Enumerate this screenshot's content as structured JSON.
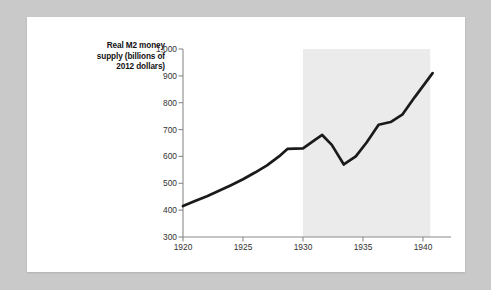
{
  "figure": {
    "background_color": "#c9c9c9",
    "card_color": "#ffffff"
  },
  "chart_data": {
    "type": "line",
    "title": "",
    "xlabel": "",
    "ylabel": "Real M2 money supply (billions of 2012 dollars)",
    "ylabel_lines": [
      "Real M2 money",
      "supply (billions of",
      "2012 dollars)"
    ],
    "xlim": [
      1920,
      1941
    ],
    "ylim": [
      300,
      1000
    ],
    "grid": false,
    "legend": null,
    "line_color": "#1a1a1a",
    "shade_color": "#ebebeb",
    "y_ticks": [
      300,
      400,
      500,
      600,
      700,
      800,
      900,
      1000
    ],
    "y_tick_labels": [
      "300",
      "400",
      "500",
      "600",
      "700",
      "800",
      "900",
      "1,000"
    ],
    "x_ticks": [
      1920,
      1925,
      1930,
      1935,
      1940
    ],
    "x_tick_labels": [
      "1920",
      "1925",
      "1930",
      "1935",
      "1940"
    ],
    "annotations": [
      {
        "text": "Great Depression",
        "x": 1936.2,
        "y": 530
      }
    ],
    "shaded_regions": [
      {
        "label": "Great Depression",
        "x_start": 1930,
        "x_end": 1940.6,
        "y_start": 300,
        "y_end": 1000
      }
    ],
    "x": [
      1920,
      1921,
      1922,
      1923,
      1924,
      1925,
      1926,
      1927,
      1928,
      1929,
      1930,
      1931,
      1932,
      1933,
      1934,
      1935,
      1936,
      1937,
      1938,
      1939,
      1940,
      1941
    ],
    "values": [
      415,
      432,
      450,
      470,
      490,
      512,
      535,
      560,
      592,
      628,
      630,
      655,
      680,
      640,
      570,
      598,
      650,
      700,
      722,
      740,
      758,
      800
    ],
    "series": [
      {
        "name": "Real M2 money supply",
        "values": [
          415,
          432,
          450,
          470,
          490,
          512,
          535,
          560,
          592,
          628,
          630,
          655,
          680,
          640,
          570,
          598,
          650,
          700,
          722,
          740,
          758,
          800
        ]
      }
    ],
    "data_points": [
      {
        "x": 1920.0,
        "y": 415
      },
      {
        "x": 1921.0,
        "y": 434
      },
      {
        "x": 1922.0,
        "y": 452
      },
      {
        "x": 1923.0,
        "y": 472
      },
      {
        "x": 1924.0,
        "y": 493
      },
      {
        "x": 1925.0,
        "y": 515
      },
      {
        "x": 1926.0,
        "y": 540
      },
      {
        "x": 1927.0,
        "y": 567
      },
      {
        "x": 1928.0,
        "y": 600
      },
      {
        "x": 1928.7,
        "y": 628
      },
      {
        "x": 1930.0,
        "y": 630
      },
      {
        "x": 1931.0,
        "y": 662
      },
      {
        "x": 1931.6,
        "y": 680
      },
      {
        "x": 1932.4,
        "y": 643
      },
      {
        "x": 1933.4,
        "y": 570
      },
      {
        "x": 1934.4,
        "y": 600
      },
      {
        "x": 1935.3,
        "y": 652
      },
      {
        "x": 1936.3,
        "y": 718
      },
      {
        "x": 1937.3,
        "y": 728
      },
      {
        "x": 1938.3,
        "y": 757
      },
      {
        "x": 1939.3,
        "y": 820
      },
      {
        "x": 1940.8,
        "y": 910
      }
    ]
  }
}
